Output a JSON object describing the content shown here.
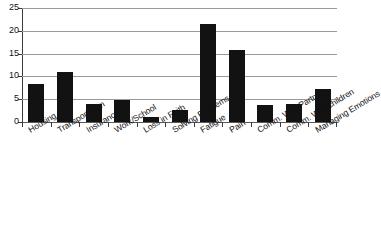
{
  "chart_data": {
    "type": "bar",
    "title": "",
    "xlabel": "",
    "ylabel": "",
    "ylim": [
      0,
      25
    ],
    "yticks": [
      0,
      5,
      10,
      15,
      20,
      25
    ],
    "grid": true,
    "legend": false,
    "bar_color": "#121212",
    "categories": [
      "Housing",
      "Transportation",
      "Insurance",
      "Work/School",
      "Loss in Faith",
      "Solving Problems",
      "Fatigue",
      "Pain",
      "Comm. With Partner",
      "Comm. With children",
      "Managing Emotions"
    ],
    "values": [
      8.3,
      11.0,
      3.9,
      4.9,
      1.1,
      2.6,
      21.5,
      15.7,
      3.8,
      4.0,
      7.2
    ]
  },
  "axis": {
    "y_tick_labels": [
      "0",
      "5",
      "10",
      "15",
      "20",
      "25"
    ]
  },
  "title_remnant": "cropped title"
}
